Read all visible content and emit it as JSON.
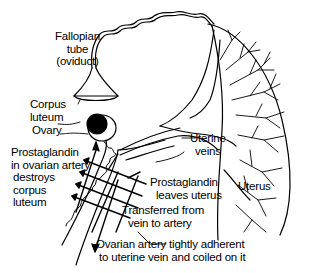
{
  "diagram": {
    "type": "anatomical-diagram",
    "labels": {
      "fallopian_tube": [
        "Fallopian",
        "tube",
        "(oviduct)"
      ],
      "corpus_luteum": [
        "Corpus",
        "luteum"
      ],
      "ovary": "Ovary",
      "prostaglandin_artery": [
        "Prostaglandin",
        "in ovarian artery",
        "destroys",
        "corpus",
        "luteum"
      ],
      "uterine_veins": [
        "Uterine",
        "veins"
      ],
      "prostaglandin_leaves": [
        "Prostaglandin",
        "leaves uterus"
      ],
      "uterus": "Uterus",
      "transferred": [
        "Transferred from",
        "vein to artery"
      ],
      "ovarian_artery": [
        "Ovarian artery tightly adherent",
        "to uterine vein and coiled on it"
      ]
    },
    "colors": {
      "line": "#000000",
      "background": "#ffffff"
    }
  }
}
